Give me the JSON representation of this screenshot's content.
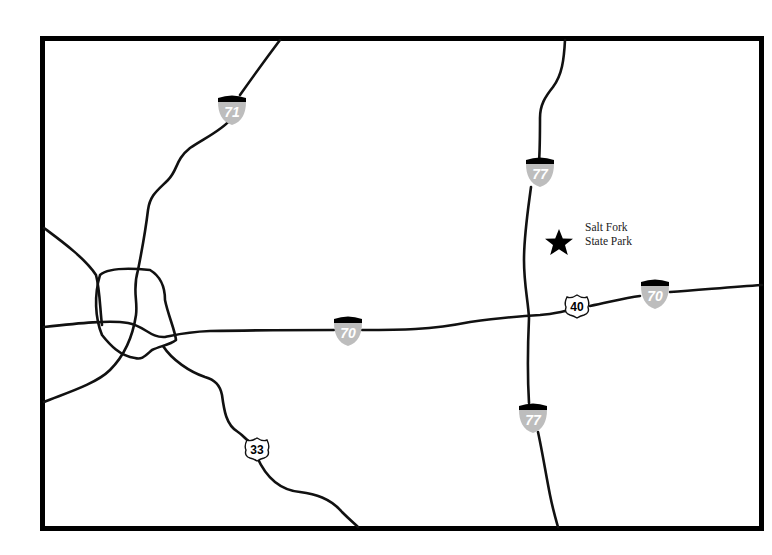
{
  "map": {
    "background": "#ffffff",
    "frame_color": "#000000",
    "road_color": "#111111",
    "interstate_shield_color": "#bdbdbd"
  },
  "shields": {
    "i71": {
      "type": "interstate",
      "number": "71"
    },
    "i77_north": {
      "type": "interstate",
      "number": "77"
    },
    "i77_south": {
      "type": "interstate",
      "number": "77"
    },
    "i70_west": {
      "type": "interstate",
      "number": "70"
    },
    "i70_east": {
      "type": "interstate",
      "number": "70"
    },
    "us40": {
      "type": "us-route",
      "number": "40"
    },
    "us33": {
      "type": "us-route",
      "number": "33"
    }
  },
  "poi": {
    "name_line1": "Salt Fork",
    "name_line2": "State Park",
    "icon": "star-icon"
  }
}
